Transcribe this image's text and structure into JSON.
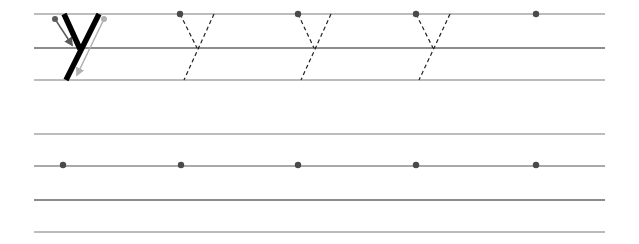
{
  "worksheet": {
    "letter": "y",
    "colors": {
      "guide_line": "#a6a6a6",
      "midline": "#8c8c8c",
      "dot": "#4a4a4a",
      "stroke": "#000000",
      "arrow_dark": "#5a5a5a",
      "arrow_light": "#b0b0b0",
      "dashed": "#222222"
    },
    "row1": {
      "lines_y": [
        14,
        48,
        80
      ],
      "model_letter": {
        "stroke1": {
          "x1": 64,
          "y1": 14,
          "x2": 80,
          "y2": 49
        },
        "stroke2": {
          "x1": 99,
          "y1": 14,
          "x2": 66,
          "y2": 80
        },
        "arrow1": {
          "start_dot": [
            55,
            19
          ],
          "x2": 72,
          "y2": 45
        },
        "arrow2": {
          "start_dot": [
            104,
            19
          ],
          "x2": 77,
          "y2": 75
        }
      },
      "traces": [
        {
          "dot_x": 180,
          "top_left_x": 180,
          "top_right_x": 214,
          "join_x": 197,
          "bottom_x": 184
        },
        {
          "dot_x": 298,
          "top_left_x": 298,
          "top_right_x": 331,
          "join_x": 314,
          "bottom_x": 301
        },
        {
          "dot_x": 416,
          "top_left_x": 416,
          "top_right_x": 450,
          "join_x": 433,
          "bottom_x": 419
        }
      ],
      "empty_dot_x": 536
    },
    "row2": {
      "lines_y": [
        134,
        166,
        200,
        232
      ],
      "dots_x": [
        63,
        181,
        298,
        416,
        536
      ],
      "dot_y": 165
    },
    "line_x_start": 34,
    "line_x_end": 605
  }
}
